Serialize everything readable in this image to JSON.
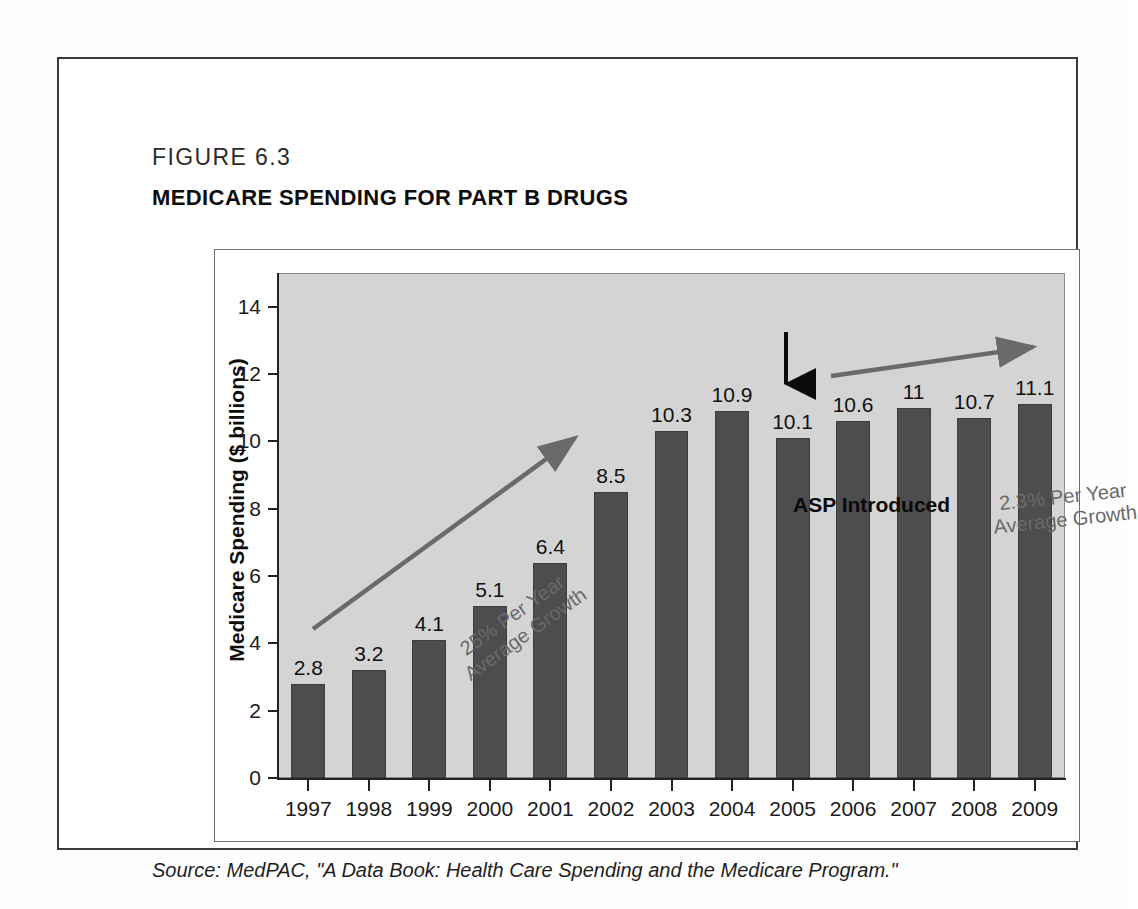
{
  "figure": {
    "number": "FIGURE 6.3",
    "title": "MEDICARE SPENDING FOR PART B DRUGS",
    "source": "Source: MedPAC, \"A Data Book: Health Care Spending and the Medicare Program.\""
  },
  "annotations": {
    "asp": "ASP Introduced",
    "growth_early_line1": "25% Per Year",
    "growth_early_line2": "Average Growth",
    "growth_late_line1": "2.3% Per Year",
    "growth_late_line2": "Average Growth"
  },
  "colors": {
    "bar": "#4d4d4d",
    "plot_background": "#d4d4d4",
    "axis": "#222222",
    "annotation": "#6a6a6a"
  },
  "chart_data": {
    "type": "bar",
    "title": "MEDICARE SPENDING FOR PART B DRUGS",
    "xlabel": "",
    "ylabel": "Medicare Spending ($ billions)",
    "categories": [
      "1997",
      "1998",
      "1999",
      "2000",
      "2001",
      "2002",
      "2003",
      "2004",
      "2005",
      "2006",
      "2007",
      "2008",
      "2009"
    ],
    "values": [
      2.8,
      3.2,
      4.1,
      5.1,
      6.4,
      8.5,
      10.3,
      10.9,
      10.1,
      10.6,
      11,
      10.7,
      11.1
    ],
    "value_labels": [
      "2.8",
      "3.2",
      "4.1",
      "5.1",
      "6.4",
      "8.5",
      "10.3",
      "10.9",
      "10.1",
      "10.6",
      "11",
      "10.7",
      "11.1"
    ],
    "ylim": [
      0,
      15
    ],
    "yticks": [
      0,
      2,
      4,
      6,
      8,
      10,
      12,
      14
    ],
    "ytick_labels": [
      "0",
      "2",
      "4",
      "6",
      "8",
      "10",
      "12",
      "14"
    ],
    "grid": false,
    "legend": "none"
  }
}
